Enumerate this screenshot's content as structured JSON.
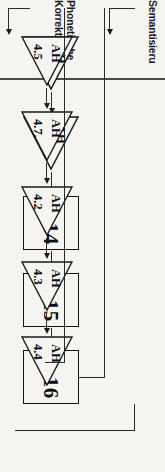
{
  "figure": {
    "orientation": "rotated-90-ccw",
    "background_color": "#f5f4f1",
    "line_color": "#2a2a2a"
  },
  "lanes": [
    {
      "id": "semantisierung",
      "label": "Semantisieru",
      "label_note": "cut off at image edge"
    },
    {
      "id": "phonetische-korrektur",
      "label_line1": "Phonetische",
      "label_line2": "Korrektur"
    }
  ],
  "boxes": [
    {
      "id": "d14",
      "label": "D 14"
    },
    {
      "id": "d15",
      "label": "D 15"
    },
    {
      "id": "d16",
      "label": "D 16"
    }
  ],
  "triangles_semantisierung": [
    {
      "id": "sem-t1",
      "tag": "AH",
      "number": "4.2"
    },
    {
      "id": "sem-t2",
      "tag": "AH",
      "number": "4.10"
    }
  ],
  "triangles_phonetisch": [
    {
      "id": "pho-t1",
      "tag": "AH",
      "number": "4.5"
    },
    {
      "id": "pho-t2",
      "tag": "AH",
      "number": "4.7."
    },
    {
      "id": "pho-t3",
      "tag": "AH",
      "number": "4.2"
    },
    {
      "id": "pho-t4",
      "tag": "AH",
      "number": "4.3"
    },
    {
      "id": "pho-t5",
      "tag": "AH",
      "number": "4.4"
    }
  ]
}
